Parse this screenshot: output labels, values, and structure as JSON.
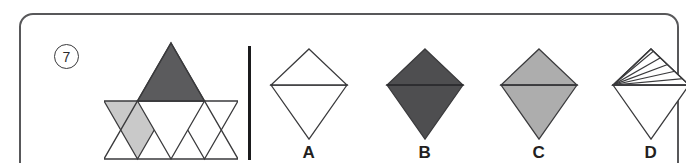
{
  "question": {
    "number": "7",
    "type": "shape-composition-multiple-choice"
  },
  "stimulus": {
    "name": "subdivided-equilateral-triangle",
    "description": "Large equilateral triangle divided into four smaller triangles: top shaded dark grey, bottom-left shaded light grey, middle inverted triangle white, bottom-right white.",
    "cells": [
      {
        "id": "top",
        "fill": "#5b5b5d",
        "label": "dark-grey-top-triangle"
      },
      {
        "id": "bottom-left",
        "fill": "#c9c9c9",
        "label": "light-grey-left-triangle"
      },
      {
        "id": "middle",
        "fill": "#ffffff",
        "label": "white-inverted-triangle"
      },
      {
        "id": "bottom-right",
        "fill": "#ffffff",
        "label": "white-right-triangle"
      }
    ]
  },
  "options": [
    {
      "id": "A",
      "label": "A",
      "name": "option-a",
      "shape": "kite",
      "top_fill": "#ffffff",
      "bottom_fill": "#ffffff",
      "pattern": "none"
    },
    {
      "id": "B",
      "label": "B",
      "name": "option-b",
      "shape": "kite",
      "top_fill": "#4e4e50",
      "bottom_fill": "#4e4e50",
      "pattern": "none"
    },
    {
      "id": "C",
      "label": "C",
      "name": "option-c",
      "shape": "kite",
      "top_fill": "#adadad",
      "bottom_fill": "#adadad",
      "pattern": "none"
    },
    {
      "id": "D",
      "label": "D",
      "name": "option-d",
      "shape": "kite",
      "top_fill": "#ffffff",
      "bottom_fill": "#ffffff",
      "pattern": "diagonal-hatch-top"
    }
  ],
  "colors": {
    "dark_grey": "#5b5b5d",
    "mid_dark_grey": "#4e4e50",
    "light_grey": "#c9c9c9",
    "option_light_grey": "#adadad",
    "outline": "#3a3a3c",
    "divider": "#1b1b1d",
    "card_border": "#58585a",
    "background": "#ffffff",
    "label_text": "#231f20"
  }
}
